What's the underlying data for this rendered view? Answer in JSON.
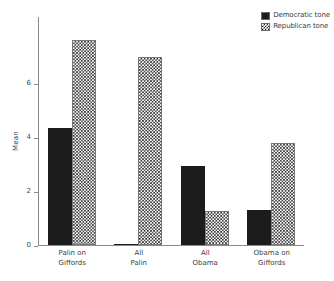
{
  "chart_data": {
    "type": "bar",
    "title": "",
    "xlabel": "",
    "ylabel": "Mean",
    "ylim": [
      0,
      6.8
    ],
    "yticks": [
      0,
      2,
      4,
      6
    ],
    "ytick_labels": [
      "0",
      "2",
      "4",
      "6"
    ],
    "grid": false,
    "legend_position": "top-right",
    "categories": [
      "Palin on\nGiffords",
      "All\nPalin",
      "All\nObama",
      "Obama on\nGiffords"
    ],
    "series": [
      {
        "name": "Democratic tone",
        "fill": "solid-black",
        "color": "#1c1c1c",
        "values": [
          3.5,
          0.03,
          2.35,
          1.05
        ]
      },
      {
        "name": "Republican tone",
        "fill": "checkered",
        "color": "#2b2b2b",
        "values": [
          6.1,
          5.6,
          1.0,
          3.05
        ]
      }
    ]
  },
  "legend": {
    "items": [
      {
        "label": "Democratic tone",
        "swatch": "solid-black-swatch"
      },
      {
        "label": "Republican tone",
        "swatch": "checkered-swatch"
      }
    ]
  },
  "axes": {
    "y_label": "Mean",
    "y_ticks": [
      "6",
      "4",
      "2",
      "0"
    ]
  }
}
